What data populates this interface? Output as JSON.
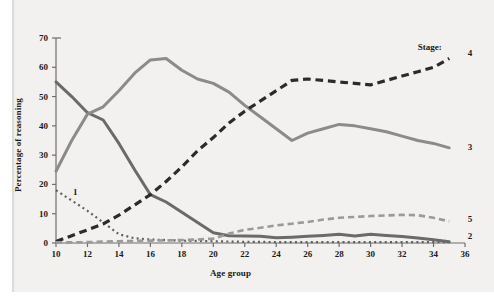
{
  "figure": {
    "background_color": "#f2f1ef",
    "legend_caption": "Stage:"
  },
  "chart_data": {
    "type": "line",
    "title": "",
    "xlabel": "Age group",
    "ylabel": "Percentage of reasoning",
    "xlim": [
      10,
      36
    ],
    "ylim": [
      0,
      70
    ],
    "xticks": [
      10,
      12,
      14,
      16,
      18,
      20,
      22,
      24,
      26,
      28,
      30,
      32,
      34,
      36
    ],
    "yticks": [
      0,
      10,
      20,
      30,
      40,
      50,
      60,
      70
    ],
    "grid": false,
    "legend_position": "inline-right-end-labels",
    "x": [
      10,
      11,
      12,
      13,
      14,
      15,
      16,
      17,
      18,
      19,
      20,
      21,
      22,
      23,
      24,
      25,
      26,
      27,
      28,
      29,
      30,
      31,
      32,
      33,
      34,
      35
    ],
    "series": [
      {
        "name": "1",
        "label": "1",
        "color": "#5f5f5f",
        "style": "dotted",
        "width": 2.2,
        "values": [
          18,
          14.5,
          11,
          7,
          3,
          1.6,
          1.2,
          1.0,
          0.8,
          0.7,
          0.6,
          0.5,
          0.4,
          0.4,
          0.3,
          0.3,
          0.3,
          0.3,
          0.3,
          0.3,
          0.3,
          0.3,
          0.3,
          0.3,
          0.3,
          0.3
        ],
        "label_x": 11.2,
        "label_y": 17.0
      },
      {
        "name": "2",
        "label": "2",
        "color": "#6a6a6a",
        "style": "solid",
        "width": 3.0,
        "values": [
          55,
          50,
          44.5,
          42,
          34,
          25,
          16.5,
          14,
          10.5,
          7,
          3.5,
          2.5,
          2.4,
          2.3,
          1.8,
          2.0,
          2.3,
          2.6,
          3.0,
          2.4,
          3.0,
          2.6,
          2.2,
          1.7,
          1.1,
          0.4
        ],
        "label_x": 36.3,
        "label_y": 2.2
      },
      {
        "name": "3",
        "label": "3",
        "color": "#8b8b8b",
        "style": "solid",
        "width": 3.0,
        "values": [
          24.5,
          35,
          44,
          46.5,
          52,
          58,
          62.5,
          63,
          59,
          56,
          54.5,
          51.5,
          47,
          43,
          39,
          35,
          37.5,
          39,
          40.5,
          40,
          39,
          38,
          36.5,
          35,
          34,
          32.5
        ],
        "label_x": 36.3,
        "label_y": 32.5
      },
      {
        "name": "4",
        "label": "4",
        "color": "#2b2b2b",
        "style": "dashed",
        "width": 3.2,
        "values": [
          0.5,
          2.5,
          4.5,
          6.5,
          9.5,
          13,
          16.5,
          21,
          26,
          31.5,
          36,
          41,
          45,
          48.5,
          52,
          55.5,
          56,
          55.5,
          55,
          54.5,
          54,
          55.5,
          57,
          58.5,
          60,
          63
        ],
        "label_x": 36.3,
        "label_y": 64.5
      },
      {
        "name": "5",
        "label": "5",
        "color": "#9a9a9a",
        "style": "dashed",
        "width": 2.6,
        "values": [
          0.2,
          0.2,
          0.3,
          0.5,
          0.6,
          0.7,
          0.8,
          0.9,
          1.0,
          1.2,
          1.5,
          3.2,
          4.5,
          5.2,
          6.0,
          6.6,
          7.2,
          8.0,
          8.6,
          8.9,
          9.2,
          9.4,
          9.6,
          9.5,
          8.6,
          7.4
        ],
        "label_x": 36.3,
        "label_y": 8.0
      }
    ]
  },
  "labels": {
    "y_axis_title": "Percentage of reasoning",
    "x_axis_title": "Age group"
  }
}
